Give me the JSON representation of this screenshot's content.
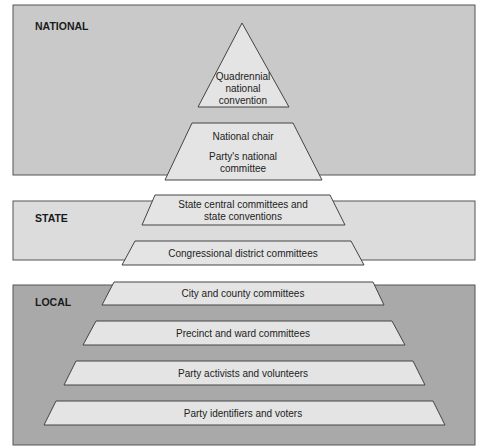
{
  "colors": {
    "national_bg": "#c9c9c9",
    "state_bg": "#dcdcdc",
    "local_bg": "#a9a9a9",
    "shape_fill": "#e4e4e4",
    "stroke": "#444444"
  },
  "levels": [
    {
      "label": "NATIONAL"
    },
    {
      "label": "STATE"
    },
    {
      "label": "LOCAL"
    }
  ],
  "nodes": [
    {
      "level": "NATIONAL",
      "lines": [
        "Quadrennial",
        "national",
        "convention"
      ]
    },
    {
      "level": "NATIONAL",
      "lines": [
        "National chair",
        "Party's national",
        "committee"
      ]
    },
    {
      "level": "STATE",
      "lines": [
        "State central committees and",
        "state conventions"
      ]
    },
    {
      "level": "STATE",
      "lines": [
        "Congressional district committees"
      ]
    },
    {
      "level": "LOCAL",
      "lines": [
        "City and county committees"
      ]
    },
    {
      "level": "LOCAL",
      "lines": [
        "Precinct and ward committees"
      ]
    },
    {
      "level": "LOCAL",
      "lines": [
        "Party activists and volunteers"
      ]
    },
    {
      "level": "LOCAL",
      "lines": [
        "Party identifiers and voters"
      ]
    }
  ]
}
